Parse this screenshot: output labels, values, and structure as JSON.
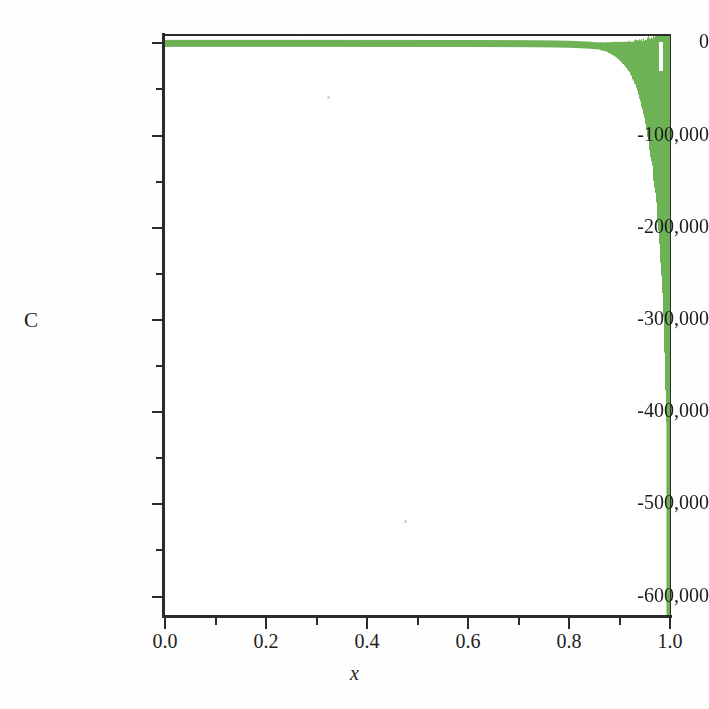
{
  "chart_data": {
    "type": "line",
    "title": "",
    "subtitle": "",
    "xlabel": "x",
    "ylabel": "C",
    "xlim": [
      0.0,
      1.0
    ],
    "ylim": [
      -620000,
      8000
    ],
    "grid": false,
    "legend": null,
    "series_color": "#6db355",
    "axis_color": "#2b2b2b",
    "background": "#ffffff",
    "x_ticks": [
      {
        "value": 0.0,
        "label": "0.0",
        "major": true
      },
      {
        "value": 0.1,
        "label": "",
        "major": false
      },
      {
        "value": 0.2,
        "label": "0.2",
        "major": true
      },
      {
        "value": 0.3,
        "label": "",
        "major": false
      },
      {
        "value": 0.4,
        "label": "0.4",
        "major": true
      },
      {
        "value": 0.5,
        "label": "",
        "major": false
      },
      {
        "value": 0.6,
        "label": "0.6",
        "major": true
      },
      {
        "value": 0.7,
        "label": "",
        "major": false
      },
      {
        "value": 0.8,
        "label": "0.8",
        "major": true
      },
      {
        "value": 0.9,
        "label": "",
        "major": false
      },
      {
        "value": 1.0,
        "label": "1.0",
        "major": true
      }
    ],
    "y_ticks": [
      {
        "value": 0,
        "label": "0",
        "major": true
      },
      {
        "value": -50000,
        "label": "",
        "major": false
      },
      {
        "value": -100000,
        "label": "-100,000",
        "major": true
      },
      {
        "value": -150000,
        "label": "",
        "major": false
      },
      {
        "value": -200000,
        "label": "-200,000",
        "major": true
      },
      {
        "value": -250000,
        "label": "",
        "major": false
      },
      {
        "value": -300000,
        "label": "-300,000",
        "major": true
      },
      {
        "value": -350000,
        "label": "",
        "major": false
      },
      {
        "value": -400000,
        "label": "-400,000",
        "major": true
      },
      {
        "value": -450000,
        "label": "",
        "major": false
      },
      {
        "value": -500000,
        "label": "-500,000",
        "major": true
      },
      {
        "value": -550000,
        "label": "",
        "major": false
      },
      {
        "value": -600000,
        "label": "-600,000",
        "major": true
      }
    ],
    "envelope": {
      "comment": "Sampled upper/lower bound of the oscillation band, read off the figure.",
      "x": [
        0.0,
        0.1,
        0.2,
        0.3,
        0.4,
        0.5,
        0.6,
        0.7,
        0.76,
        0.8,
        0.83,
        0.855,
        0.875,
        0.89,
        0.9,
        0.912,
        0.922,
        0.93,
        0.938,
        0.945,
        0.951,
        0.956,
        0.961,
        0.966,
        0.97,
        0.974,
        0.977,
        0.98,
        0.983,
        0.9855,
        0.9875,
        0.9895,
        0.991,
        0.9925,
        0.9938,
        0.9948,
        0.9957,
        0.9965,
        0.9972,
        0.9978,
        0.9984,
        0.9989,
        0.9993,
        0.9996,
        0.9998,
        1.0
      ],
      "upper": [
        600,
        600,
        600,
        600,
        600,
        620,
        650,
        700,
        760,
        820,
        900,
        980,
        1100,
        1250,
        1400,
        1600,
        1900,
        2300,
        2800,
        3400,
        4200,
        5200,
        6400,
        7800,
        9500,
        11500,
        14000,
        17000,
        20500,
        24500,
        29000,
        34000,
        40000,
        46000,
        53000,
        60000,
        68000,
        76000,
        85000,
        94000,
        104000,
        114000,
        125000,
        136000,
        148000,
        160000
      ],
      "lower": [
        -600,
        -600,
        -620,
        -640,
        -680,
        -760,
        -900,
        -1300,
        -1900,
        -2700,
        -4200,
        -6000,
        -9000,
        -13500,
        -18000,
        -25000,
        -33000,
        -43000,
        -55000,
        -69000,
        -84000,
        -100000,
        -118000,
        -137000,
        -158000,
        -180000,
        -203000,
        -227000,
        -252000,
        -278000,
        -305000,
        -333000,
        -362000,
        -392000,
        -423000,
        -455000,
        -488000,
        -521000,
        -553000,
        -578000,
        -596000,
        -608000,
        -615000,
        -619000,
        -620000,
        -620000
      ]
    },
    "features": [
      {
        "name": "flat-band-region",
        "x_range": [
          0.0,
          0.88
        ],
        "note": "band visually pinned to zero line"
      },
      {
        "name": "divergence-onset",
        "x": 0.88
      },
      {
        "name": "white-gap-notch",
        "x_range": [
          0.978,
          0.987
        ],
        "note": "light gap in the dense band near the top"
      },
      {
        "name": "deep-spike",
        "x_range": [
          0.993,
          1.0
        ],
        "note": "narrow spike reaching past -600,000"
      }
    ]
  }
}
